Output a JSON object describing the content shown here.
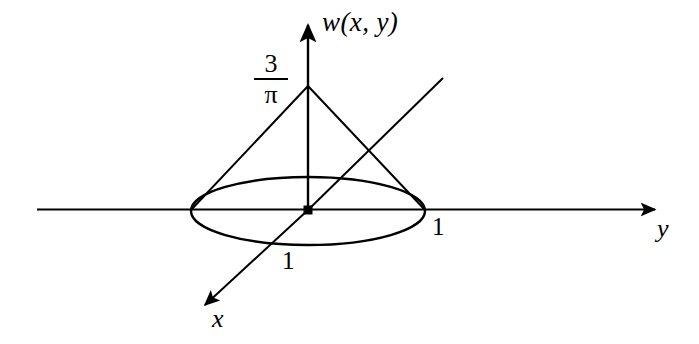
{
  "figure": {
    "kind": "3d-cone-graph-diagram",
    "background_color": "#ffffff",
    "stroke_color": "#000000",
    "axes": [
      {
        "name": "w",
        "label": "w(x, y)",
        "direction": "up",
        "arrow": true
      },
      {
        "name": "y",
        "label": "y",
        "direction": "right",
        "arrow": true
      },
      {
        "name": "x",
        "label": "x",
        "direction": "down-left",
        "arrow": true
      }
    ],
    "labels": {
      "w_axis": "w(x, y)",
      "y_axis": "y",
      "x_axis": "x",
      "apex_value_numerator": "3",
      "apex_value_denominator": "π",
      "tick_y_one": "1",
      "tick_x_one": "1"
    },
    "geometry": {
      "origin": {
        "x": 308,
        "y": 210
      },
      "apex": {
        "x": 308,
        "y": 86
      },
      "apex_height_value": "3/π",
      "base_circle_radius_value": "1",
      "base_ellipse": {
        "center_x": 308,
        "center_y": 211,
        "semi_major_x": 117,
        "semi_minor_y": 34
      },
      "w_axis_arrow_tip": {
        "x": 308,
        "y": 18
      },
      "y_axis_line": {
        "x1": 37,
        "y1": 209,
        "x2": 662,
        "y2": 209
      },
      "x_axis_line": {
        "x1": 443,
        "y1": 78,
        "x2": 201,
        "y2": 309
      },
      "slant_left_end": {
        "x": 191,
        "y": 209
      },
      "slant_right_end": {
        "x": 425,
        "y": 209
      },
      "origin_marker": "filled-square"
    }
  }
}
